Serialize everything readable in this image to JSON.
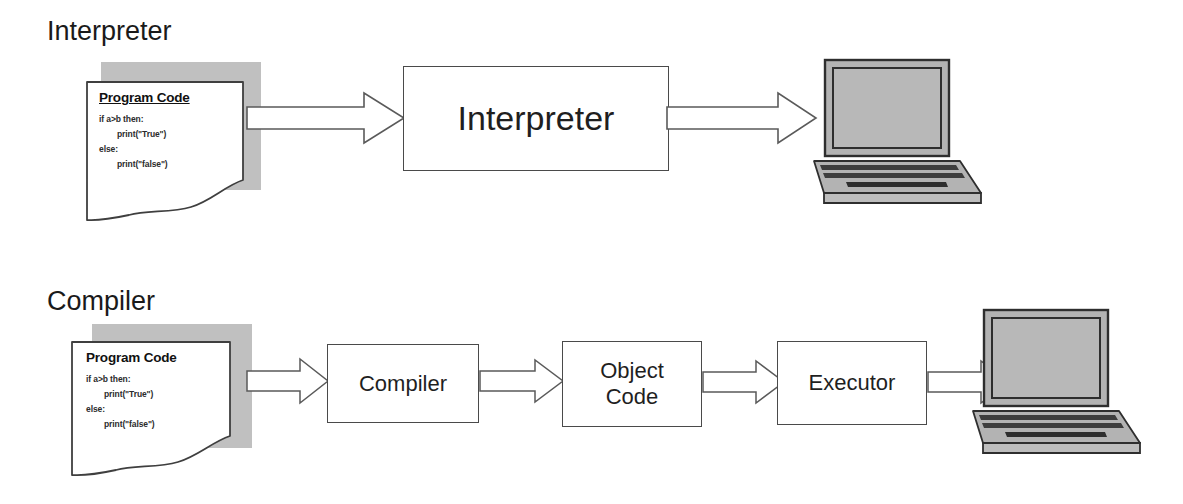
{
  "page": {
    "width": 1183,
    "height": 504,
    "background": "#ffffff"
  },
  "palette": {
    "outline": "#4a4a4a",
    "paper_shadow_gray": "#c0c0c0",
    "laptop_gray": "#b3b3b3",
    "laptop_dark": "#3d3d3d",
    "text": "#1a1a1a",
    "arrow_fill": "#ffffff"
  },
  "sections": [
    {
      "id": "interpreter",
      "title": "Interpreter",
      "document": {
        "title": "Program Code",
        "title_underlined": true,
        "lines": [
          {
            "text": "if a>b then:",
            "indent": false
          },
          {
            "text": "print(\"True\")",
            "indent": true
          },
          {
            "text": "else:",
            "indent": false
          },
          {
            "text": "print(\"false\")",
            "indent": true
          }
        ]
      },
      "boxes": [
        {
          "id": "interpreter-box",
          "label": "Interpreter",
          "font_size": 34
        }
      ],
      "output": {
        "icon": "laptop-icon",
        "label": "laptop"
      },
      "arrows": [
        {
          "id": "arrow-code-to-interpreter",
          "from": "program-code",
          "to": "interpreter-box"
        },
        {
          "id": "arrow-interpreter-to-laptop",
          "from": "interpreter-box",
          "to": "laptop"
        }
      ]
    },
    {
      "id": "compiler",
      "title": "Compiler",
      "document": {
        "title": "Program Code",
        "title_underlined": false,
        "lines": [
          {
            "text": "if a>b then:",
            "indent": false
          },
          {
            "text": "print(\"True\")",
            "indent": true
          },
          {
            "text": "else:",
            "indent": false
          },
          {
            "text": "print(\"false\")",
            "indent": true
          }
        ]
      },
      "boxes": [
        {
          "id": "compiler-box",
          "label": "Compiler",
          "font_size": 22
        },
        {
          "id": "object-code-box",
          "label": "Object\nCode",
          "font_size": 22
        },
        {
          "id": "executor-box",
          "label": "Executor",
          "font_size": 22
        }
      ],
      "output": {
        "icon": "laptop-icon",
        "label": "laptop"
      },
      "arrows": [
        {
          "id": "arrow-code-to-compiler",
          "from": "program-code",
          "to": "compiler-box"
        },
        {
          "id": "arrow-compiler-to-object",
          "from": "compiler-box",
          "to": "object-code-box"
        },
        {
          "id": "arrow-object-to-executor",
          "from": "object-code-box",
          "to": "executor-box"
        },
        {
          "id": "arrow-executor-to-laptop",
          "from": "executor-box",
          "to": "laptop"
        }
      ]
    }
  ],
  "labels": {
    "interpreter_title": "Interpreter",
    "compiler_title": "Compiler",
    "interpreter_box": "Interpreter",
    "compiler_box": "Compiler",
    "object_code_line1": "Object",
    "object_code_line2": "Code",
    "executor_box": "Executor",
    "program_code_title": "Program Code",
    "code_line_1": "if a>b then:",
    "code_line_2": "print(\"True\")",
    "code_line_3": "else:",
    "code_line_4": "print(\"false\")"
  }
}
